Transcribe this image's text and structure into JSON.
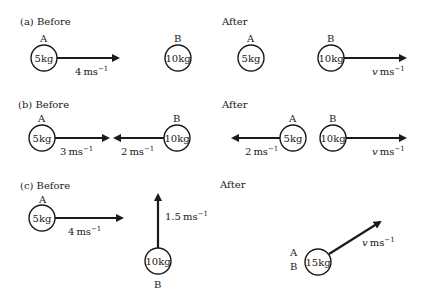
{
  "sections": [
    {
      "id": "a",
      "before_title": "(a) Before",
      "after_title": "After",
      "before": {
        "A": {
          "label": "A",
          "mass": "5kg",
          "velocity": "4",
          "unit": "ms",
          "exp": "−1"
        },
        "B": {
          "label": "B",
          "mass": "10kg"
        }
      },
      "after": {
        "A": {
          "label": "A",
          "mass": "5kg"
        },
        "B": {
          "label": "B",
          "mass": "10kg",
          "velocity": "v",
          "unit": "ms",
          "exp": "−1"
        }
      }
    },
    {
      "id": "b",
      "before_title": "(b) Before",
      "after_title": "After",
      "before": {
        "A": {
          "label": "A",
          "mass": "5kg",
          "velocity": "3",
          "unit": "ms",
          "exp": "−1"
        },
        "B": {
          "label": "B",
          "mass": "10kg",
          "velocity": "2",
          "unit": "ms",
          "exp": "−1"
        }
      },
      "after": {
        "A": {
          "label": "A",
          "mass": "5kg",
          "velocity": "2",
          "unit": "ms",
          "exp": "−1"
        },
        "B": {
          "label": "B",
          "mass": "10kg",
          "velocity": "v",
          "unit": "ms",
          "exp": "−1"
        }
      }
    },
    {
      "id": "c",
      "before_title": "(c) Before",
      "after_title": "After",
      "before": {
        "A": {
          "label": "A",
          "mass": "5kg",
          "velocity": "4",
          "unit": "ms",
          "exp": "−1"
        },
        "B": {
          "label": "B",
          "mass": "10kg",
          "velocity": "1.5",
          "unit": "ms",
          "exp": "−1"
        }
      },
      "after": {
        "AB": {
          "label_top": "A",
          "label_bottom": "B",
          "mass": "15kg",
          "velocity": "v",
          "unit": "ms",
          "exp": "−1"
        }
      }
    }
  ]
}
